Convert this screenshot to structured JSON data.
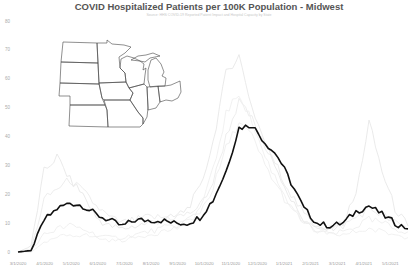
{
  "chart_data": {
    "type": "line",
    "title": "COVID Hospitalized Patients per 100K Population - Midwest",
    "subtitle": "Source: HHS COVID-19 Reported Patient Impact and Hospital Capacity by State",
    "xlabel": "",
    "ylabel": "",
    "ylim": [
      0,
      80
    ],
    "yticks": [
      "0",
      "10",
      "20",
      "30",
      "40",
      "50",
      "60",
      "70",
      "80"
    ],
    "xticks": [
      "3/1/2020",
      "4/1/2020",
      "5/1/2020",
      "6/1/2020",
      "7/1/2020",
      "8/1/2020",
      "9/1/2020",
      "10/1/2020",
      "11/1/2020",
      "12/1/2020",
      "1/1/2021",
      "2/1/2021",
      "3/1/2021",
      "4/1/2021",
      "5/1/2021"
    ],
    "grid": false,
    "legend": "none",
    "inset": "Outline map of Midwest states",
    "series": [
      {
        "name": "Midwest (highlighted)",
        "color": "#111111",
        "x": [
          "3/1/2020",
          "3/20/2020",
          "4/1/2020",
          "4/15/2020",
          "5/1/2020",
          "5/15/2020",
          "6/1/2020",
          "6/15/2020",
          "7/1/2020",
          "7/15/2020",
          "8/1/2020",
          "8/15/2020",
          "9/1/2020",
          "9/15/2020",
          "10/1/2020",
          "10/15/2020",
          "11/1/2020",
          "11/15/2020",
          "12/1/2020",
          "12/15/2020",
          "1/1/2021",
          "1/15/2021",
          "2/1/2021",
          "2/15/2021",
          "3/1/2021",
          "3/15/2021",
          "4/1/2021",
          "4/15/2021",
          "5/1/2021",
          "5/15/2021",
          "5/31/2021"
        ],
        "values": [
          0,
          0.5,
          11,
          15,
          17,
          16,
          13,
          11,
          9,
          11,
          11,
          11,
          10,
          10,
          12,
          18,
          28,
          43,
          44,
          38,
          33,
          24,
          15,
          10,
          9,
          10,
          14,
          16,
          13,
          10,
          8
        ]
      },
      {
        "name": "State A (faint)",
        "color": "#e4e4e4",
        "values": [
          0,
          2,
          28,
          33,
          25,
          20,
          12,
          9,
          8,
          9,
          10,
          11,
          12,
          15,
          22,
          38,
          62,
          68,
          50,
          38,
          28,
          18,
          11,
          8,
          8,
          10,
          20,
          45,
          28,
          15,
          9
        ]
      },
      {
        "name": "State B (faint)",
        "color": "#e8e8e8",
        "values": [
          0,
          1,
          18,
          22,
          25,
          21,
          16,
          12,
          10,
          11,
          12,
          12,
          12,
          13,
          16,
          24,
          40,
          52,
          46,
          36,
          29,
          20,
          13,
          9,
          8,
          9,
          12,
          15,
          13,
          10,
          8
        ]
      },
      {
        "name": "State C (faint)",
        "color": "#ececec",
        "values": [
          0,
          0.5,
          6,
          8,
          9,
          8,
          6,
          5,
          5,
          6,
          7,
          8,
          9,
          11,
          14,
          22,
          36,
          45,
          40,
          30,
          22,
          15,
          10,
          7,
          6,
          7,
          9,
          11,
          10,
          8,
          7
        ]
      },
      {
        "name": "State D (faint)",
        "color": "#eeeeee",
        "values": [
          0,
          0,
          3,
          5,
          6,
          6,
          5,
          4,
          4,
          5,
          6,
          7,
          8,
          10,
          15,
          28,
          48,
          55,
          45,
          33,
          24,
          16,
          10,
          7,
          6,
          6,
          7,
          8,
          7,
          6,
          5
        ]
      }
    ]
  }
}
